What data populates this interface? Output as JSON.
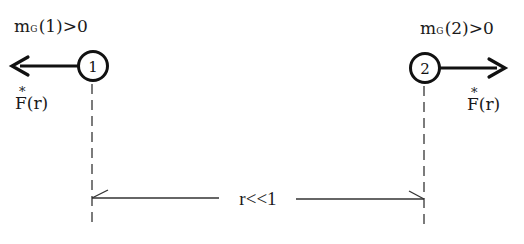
{
  "diagram": {
    "particles": [
      {
        "id": "1",
        "label_number": "1",
        "mass_label": {
          "symbol": "m",
          "subscript": "G",
          "argument": "(1)",
          "relation": ">",
          "value": "0"
        },
        "force_label": {
          "star": "*",
          "symbol": "F",
          "argument": "(r)"
        },
        "force_direction": "left"
      },
      {
        "id": "2",
        "label_number": "2",
        "mass_label": {
          "symbol": "m",
          "subscript": "G",
          "argument": "(2)",
          "relation": ">",
          "value": "0"
        },
        "force_label": {
          "star": "*",
          "symbol": "F",
          "argument": "(r)"
        },
        "force_direction": "right"
      }
    ],
    "separation": {
      "label": "r<<1"
    },
    "colors": {
      "ink": "#1a1a1a",
      "dashed": "#444444",
      "background": "#ffffff"
    }
  }
}
